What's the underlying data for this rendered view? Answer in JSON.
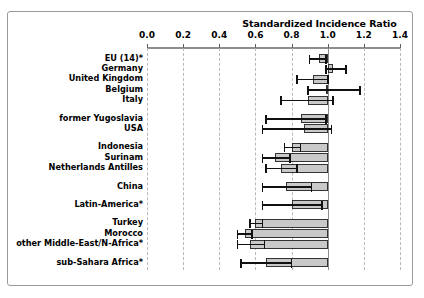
{
  "chart_data": {
    "type": "bar",
    "title": "Standardized Incidence Ratio",
    "xlabel": "Standardized Incidence Ratio",
    "ylabel": "",
    "xlim": [
      0.0,
      1.4
    ],
    "xticks": [
      0.0,
      0.2,
      0.4,
      0.6,
      0.8,
      1.0,
      1.2,
      1.4
    ],
    "xticklabels": [
      "0.0",
      "0.2",
      "0.4",
      "0.6",
      "0.8",
      "1.0",
      "1.2",
      "1.4"
    ],
    "grid": true,
    "grid_axis": "x",
    "reference_line": 1.0,
    "legend": null,
    "orientation": "horizontal",
    "bar_anchor": 1.0,
    "categories": [
      "EU (14)*",
      "Germany",
      "United Kingdom",
      "Belgium",
      "Italy",
      "former Yugoslavia",
      "USA",
      "Indonesia",
      "Surinam",
      "Netherlands Antilles",
      "China",
      "Latin-America*",
      "Turkey",
      "Morocco",
      "other Middle-East/N-Africa*",
      "sub-Sahara Africa*"
    ],
    "groups": [
      {
        "start": 0,
        "count": 5
      },
      {
        "start": 5,
        "count": 2
      },
      {
        "start": 7,
        "count": 3
      },
      {
        "start": 10,
        "count": 1
      },
      {
        "start": 11,
        "count": 1
      },
      {
        "start": 12,
        "count": 3
      },
      {
        "start": 15,
        "count": 1
      }
    ],
    "values": [
      0.95,
      1.03,
      0.92,
      0.99,
      0.89,
      0.85,
      0.87,
      0.8,
      0.71,
      0.74,
      0.77,
      0.8,
      0.6,
      0.54,
      0.57,
      0.66
    ],
    "ci_low": [
      0.9,
      0.99,
      0.83,
      0.89,
      0.74,
      0.66,
      0.64,
      0.76,
      0.64,
      0.66,
      0.64,
      0.64,
      0.57,
      0.5,
      0.5,
      0.52
    ],
    "ci_high": [
      0.99,
      1.1,
      1.0,
      1.18,
      1.03,
      0.99,
      1.02,
      0.85,
      0.79,
      0.83,
      0.91,
      0.97,
      0.64,
      0.58,
      0.65,
      0.8
    ]
  },
  "style": {
    "bar_fill": "#c9c9c9",
    "bar_stroke": "#333333",
    "grid_color": "#b9b9b9",
    "axis_color": "#8d8d8d",
    "error_color": "#111111",
    "text_color": "#000000",
    "background": "#ffffff"
  }
}
